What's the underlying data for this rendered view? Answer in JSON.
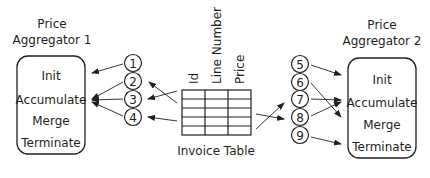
{
  "aggregator1": {
    "title_line1": "Price",
    "title_line2": "Aggregator 1",
    "operations": [
      "Init",
      "Accumulate",
      "Merge",
      "Terminate"
    ]
  },
  "aggregator2": {
    "title_line1": "Price",
    "title_line2": "Aggregator 2",
    "operations": [
      "Init",
      "Accumulate",
      "Merge",
      "Terminate"
    ]
  },
  "table": {
    "caption": "Invoice Table",
    "columns": [
      "Id",
      "Line Number",
      "Price"
    ],
    "rows": 5
  },
  "left_nodes": [
    "1",
    "2",
    "3",
    "4"
  ],
  "right_nodes": [
    "5",
    "6",
    "7",
    "8",
    "9"
  ],
  "colors": {
    "stroke": "#231f20",
    "background": "#ffffff"
  }
}
